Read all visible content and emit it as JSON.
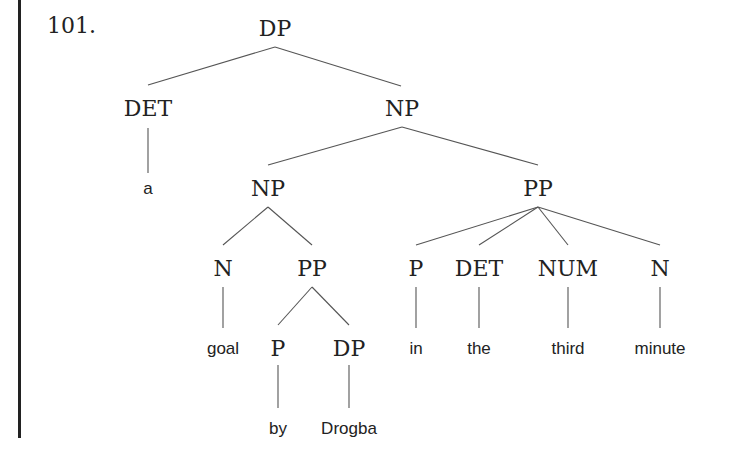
{
  "example": {
    "number": "101."
  },
  "tree": {
    "nodes": [
      {
        "id": "dp_root",
        "label": "DP",
        "type": "cat",
        "x": 275,
        "y": 36
      },
      {
        "id": "det_a",
        "label": "DET",
        "type": "cat",
        "x": 148,
        "y": 116
      },
      {
        "id": "np_top",
        "label": "NP",
        "type": "cat",
        "x": 402,
        "y": 116
      },
      {
        "id": "leaf_a",
        "label": "a",
        "type": "leaf",
        "x": 148,
        "y": 194
      },
      {
        "id": "np_inner",
        "label": "NP",
        "type": "cat",
        "x": 268,
        "y": 196
      },
      {
        "id": "pp_right",
        "label": "PP",
        "type": "cat",
        "x": 538,
        "y": 196
      },
      {
        "id": "n_goal",
        "label": "N",
        "type": "cat",
        "x": 223,
        "y": 276
      },
      {
        "id": "pp_by",
        "label": "PP",
        "type": "cat",
        "x": 312,
        "y": 276
      },
      {
        "id": "p_in",
        "label": "P",
        "type": "cat",
        "x": 416,
        "y": 276
      },
      {
        "id": "det_the",
        "label": "DET",
        "type": "cat",
        "x": 479,
        "y": 276
      },
      {
        "id": "num_third",
        "label": "NUM",
        "type": "cat",
        "x": 568,
        "y": 276
      },
      {
        "id": "n_minute",
        "label": "N",
        "type": "cat",
        "x": 660,
        "y": 276
      },
      {
        "id": "leaf_goal",
        "label": "goal",
        "type": "leaf",
        "x": 223,
        "y": 354
      },
      {
        "id": "p_by",
        "label": "P",
        "type": "cat",
        "x": 278,
        "y": 356
      },
      {
        "id": "dp_drogba",
        "label": "DP",
        "type": "cat",
        "x": 349,
        "y": 356
      },
      {
        "id": "leaf_in",
        "label": "in",
        "type": "leaf",
        "x": 416,
        "y": 354
      },
      {
        "id": "leaf_the",
        "label": "the",
        "type": "leaf",
        "x": 479,
        "y": 354
      },
      {
        "id": "leaf_third",
        "label": "third",
        "type": "leaf",
        "x": 568,
        "y": 354
      },
      {
        "id": "leaf_minute",
        "label": "minute",
        "type": "leaf",
        "x": 660,
        "y": 354
      },
      {
        "id": "leaf_by",
        "label": "by",
        "type": "leaf",
        "x": 278,
        "y": 434
      },
      {
        "id": "leaf_drogba",
        "label": "Drogba",
        "type": "leaf",
        "x": 349,
        "y": 434
      }
    ],
    "edges": [
      {
        "x1": 275,
        "y1": 47,
        "x2": 148,
        "y2": 85
      },
      {
        "x1": 275,
        "y1": 47,
        "x2": 401,
        "y2": 86
      },
      {
        "x1": 148,
        "y1": 128,
        "x2": 148,
        "y2": 173
      },
      {
        "x1": 402,
        "y1": 127,
        "x2": 268,
        "y2": 165
      },
      {
        "x1": 402,
        "y1": 127,
        "x2": 538,
        "y2": 165
      },
      {
        "x1": 268,
        "y1": 207,
        "x2": 223,
        "y2": 245
      },
      {
        "x1": 268,
        "y1": 207,
        "x2": 312,
        "y2": 245
      },
      {
        "x1": 538,
        "y1": 207,
        "x2": 416,
        "y2": 245
      },
      {
        "x1": 538,
        "y1": 207,
        "x2": 479,
        "y2": 245
      },
      {
        "x1": 538,
        "y1": 207,
        "x2": 568,
        "y2": 245
      },
      {
        "x1": 538,
        "y1": 207,
        "x2": 660,
        "y2": 245
      },
      {
        "x1": 223,
        "y1": 287,
        "x2": 223,
        "y2": 328
      },
      {
        "x1": 312,
        "y1": 287,
        "x2": 278,
        "y2": 325
      },
      {
        "x1": 312,
        "y1": 287,
        "x2": 349,
        "y2": 325
      },
      {
        "x1": 416,
        "y1": 287,
        "x2": 416,
        "y2": 328
      },
      {
        "x1": 479,
        "y1": 287,
        "x2": 479,
        "y2": 328
      },
      {
        "x1": 568,
        "y1": 287,
        "x2": 568,
        "y2": 328
      },
      {
        "x1": 660,
        "y1": 287,
        "x2": 660,
        "y2": 328
      },
      {
        "x1": 278,
        "y1": 365,
        "x2": 278,
        "y2": 408
      },
      {
        "x1": 349,
        "y1": 365,
        "x2": 349,
        "y2": 408
      }
    ]
  }
}
